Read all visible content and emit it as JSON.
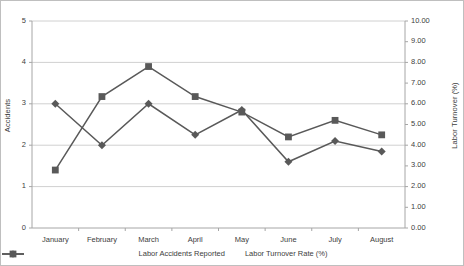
{
  "chart_data": {
    "type": "line",
    "title": "",
    "xlabel": "",
    "categories": [
      "January",
      "February",
      "March",
      "April",
      "May",
      "June",
      "July",
      "August"
    ],
    "grid": true,
    "legend_position": "bottom",
    "axes": {
      "left": {
        "label": "Accidents",
        "min": 0,
        "max": 5,
        "step": 1,
        "ticks": [
          "0",
          "1",
          "2",
          "3",
          "4",
          "5"
        ]
      },
      "right": {
        "label": "Labor Turnover (%)",
        "min": 0,
        "max": 10,
        "step": 1,
        "ticks": [
          "0.00",
          "1.00",
          "2.00",
          "3.00",
          "4.00",
          "5.00",
          "6.00",
          "7.00",
          "8.00",
          "9.00",
          "10.00"
        ]
      }
    },
    "series": [
      {
        "name": "Labor Accidents Reported",
        "axis": "left",
        "marker": "diamond",
        "color": "#595959",
        "values": [
          3.0,
          2.0,
          3.0,
          2.25,
          2.85,
          1.6,
          2.1,
          1.85
        ]
      },
      {
        "name": "Labor Turnover Rate (%)",
        "axis": "right",
        "marker": "square",
        "color": "#595959",
        "values": [
          2.8,
          6.35,
          7.8,
          6.35,
          5.6,
          4.4,
          5.2,
          4.5
        ]
      }
    ]
  },
  "legend": {
    "items": [
      {
        "label": "Labor Accidents Reported"
      },
      {
        "label": "Labor Turnover Rate (%)"
      }
    ]
  }
}
